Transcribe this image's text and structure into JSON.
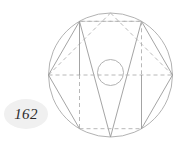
{
  "figure": {
    "caption_label": "162",
    "colors": {
      "outer_circle_stroke": "#a9a9a9",
      "inner_circle_stroke": "#a9a9a9",
      "solid_edge_stroke": "#8c8c8c",
      "dashed_edge_stroke": "#b0b0b0",
      "label_text": "#2b2b2b",
      "label_halo": "#f0f0f0",
      "background": "#ffffff"
    },
    "geometry": {
      "outer_circle": {
        "cx": 110.5,
        "cy": 75,
        "r": 62
      },
      "inner_circle": {
        "cx": 110.5,
        "cy": 72.5,
        "r": 13
      },
      "hexagon_vertices": [
        {
          "name": "right",
          "x": 172.5,
          "y": 75
        },
        {
          "name": "upper-right",
          "x": 141.5,
          "y": 21.3
        },
        {
          "name": "upper-left",
          "x": 79.5,
          "y": 21.3
        },
        {
          "name": "left",
          "x": 48.5,
          "y": 75
        },
        {
          "name": "lower-left",
          "x": 79.5,
          "y": 128.7
        },
        {
          "name": "lower-right",
          "x": 141.5,
          "y": 128.7
        }
      ],
      "triangle_up": [
        "upper-left",
        "upper-right",
        "bottom-apex"
      ],
      "triangle_down": [
        "left",
        "right",
        "top-apex"
      ],
      "vertical_chords": [
        {
          "x": 79.5,
          "y1": 21.3,
          "y2": 128.7,
          "upper_style": "solid",
          "lower_style": "dashed"
        },
        {
          "x": 141.5,
          "y1": 21.3,
          "y2": 128.7,
          "upper_style": "dashed",
          "lower_style": "solid"
        }
      ],
      "dash_pattern": "4 3"
    }
  }
}
